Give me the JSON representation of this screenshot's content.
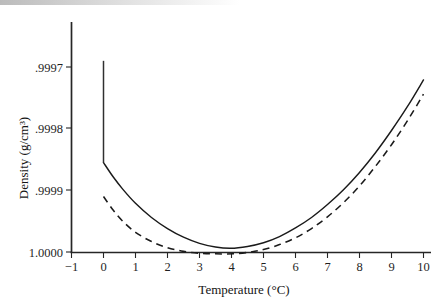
{
  "figure": {
    "kind": "scientific-line-plot",
    "background": "#ffffff",
    "ink_color": "#1a1a1a"
  },
  "chart_data": {
    "type": "line",
    "title": "",
    "subtitle": "",
    "xlabel": "Temperature (°C)",
    "ylabel": "Density (g/cm³)",
    "xlim": [
      -1,
      10
    ],
    "ylim": [
      1.0,
      0.99965
    ],
    "y_axis_inverted": true,
    "grid": false,
    "legend": "none",
    "xticks": [
      -1,
      0,
      1,
      2,
      3,
      4,
      5,
      6,
      7,
      8,
      9,
      10
    ],
    "xtick_labels": [
      "−1",
      "0",
      "1",
      "2",
      "3",
      "4",
      "5",
      "6",
      "7",
      "8",
      "9",
      "10"
    ],
    "yticks": [
      0.9997,
      0.9998,
      0.9999,
      1.0
    ],
    "ytick_labels": [
      ".9997",
      ".9998",
      ".9999",
      "1.0000"
    ],
    "annotations": [
      {
        "name": "phase-discontinuity",
        "text": "",
        "x": 0,
        "y_from": 0.99969,
        "y_to": 0.999855
      }
    ],
    "series": [
      {
        "name": "solid-curve",
        "style": "solid",
        "color": "#1a1a1a",
        "x": [
          0,
          0.3,
          0.6,
          1,
          1.5,
          2,
          2.5,
          3,
          3.5,
          3.98,
          4.5,
          5,
          5.5,
          6,
          6.5,
          7,
          7.5,
          8,
          8.5,
          9,
          9.5,
          10
        ],
        "y": [
          0.999855,
          0.999878,
          0.999898,
          0.999921,
          0.999944,
          0.999962,
          0.999976,
          0.999986,
          0.999992,
          0.999994,
          0.999991,
          0.999985,
          0.999975,
          0.999961,
          0.999944,
          0.999923,
          0.999899,
          0.999871,
          0.999839,
          0.999803,
          0.999764,
          0.999721
        ]
      },
      {
        "name": "dashed-curve",
        "style": "dashed",
        "color": "#1a1a1a",
        "x": [
          0,
          0.3,
          0.6,
          1,
          1.5,
          2,
          2.5,
          3,
          3.5,
          4.05,
          4.6,
          5,
          5.5,
          6,
          6.5,
          7,
          7.5,
          8,
          8.5,
          9,
          9.5,
          10
        ],
        "y": [
          0.99991,
          0.999932,
          0.99995,
          0.999968,
          0.999983,
          0.999993,
          0.999999,
          1.000002,
          1.000003,
          1.000003,
          1.0,
          0.999996,
          0.999988,
          0.999977,
          0.999962,
          0.999943,
          0.99992,
          0.999893,
          0.999861,
          0.999826,
          0.999787,
          0.999744
        ]
      }
    ]
  }
}
